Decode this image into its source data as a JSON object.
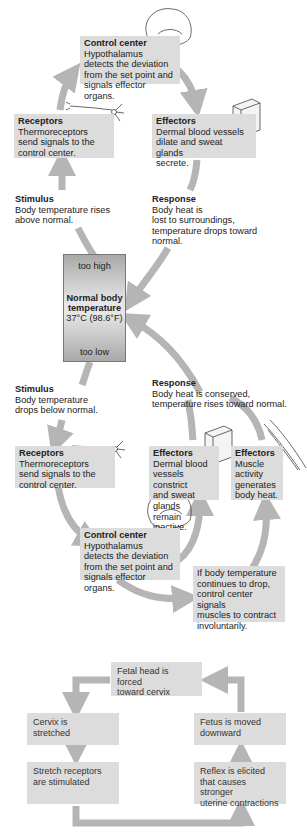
{
  "diagram": {
    "setpoint": {
      "too_high": "too high",
      "title_line1": "Normal body",
      "title_line2": "temperature",
      "value": "37°C (98.6°F)",
      "too_low": "too low"
    },
    "upper_loop": {
      "control_center": {
        "title": "Control center",
        "lines": [
          "Hypothalamus",
          "detects the deviation",
          "from the set point and",
          "signals effector organs."
        ]
      },
      "receptors": {
        "title": "Receptors",
        "lines": [
          "Thermoreceptors",
          "send signals to the",
          "control center."
        ]
      },
      "effectors": {
        "title": "Effectors",
        "lines": [
          "Dermal blood vessels",
          "dilate and sweat glands",
          "secrete."
        ]
      },
      "stimulus": {
        "title": "Stimulus",
        "lines": [
          "Body temperature rises",
          "above normal."
        ]
      },
      "response": {
        "title": "Response",
        "lines": [
          "Body heat is",
          "lost to surroundings,",
          "temperature drops toward",
          "normal."
        ]
      }
    },
    "lower_loop": {
      "stimulus": {
        "title": "Stimulus",
        "lines": [
          "Body temperature",
          "drops below normal."
        ]
      },
      "response": {
        "title": "Response",
        "lines": [
          "Body heat is conserved,",
          "temperature rises toward normal."
        ]
      },
      "receptors": {
        "title": "Receptors",
        "lines": [
          "Thermoreceptors",
          "send signals to the",
          "control center."
        ]
      },
      "effectors_skin": {
        "title": "Effectors",
        "lines": [
          "Dermal blood",
          "vessels constrict",
          "and sweat glands",
          "remain inactive."
        ]
      },
      "effectors_muscle": {
        "title": "Effectors",
        "lines": [
          "Muscle",
          "activity",
          "generates",
          "body heat."
        ]
      },
      "control_center": {
        "title": "Control center",
        "lines": [
          "Hypothalamus",
          "detects the deviation",
          "from the set point and",
          "signals effector organs."
        ]
      },
      "note": {
        "lines": [
          "If body temperature",
          "continues to drop,",
          "control center signals",
          "muscles to contract",
          "involuntarily."
        ]
      }
    }
  },
  "labor_loop": {
    "top": {
      "lines": [
        "Fetal head is forced",
        "toward cervix"
      ]
    },
    "left_top": {
      "lines": [
        "Cervix is",
        "stretched"
      ]
    },
    "left_bottom": {
      "lines": [
        "Stretch receptors",
        "are stimulated"
      ]
    },
    "right_top": {
      "lines": [
        "Fetus is moved",
        "downward"
      ]
    },
    "right_bottom": {
      "lines": [
        "Reflex is elicited",
        "that causes stronger",
        "uterine contractions"
      ]
    }
  },
  "colors": {
    "box": "#dcdcdc",
    "arrow": "#b5b5b5",
    "text": "#222222"
  }
}
